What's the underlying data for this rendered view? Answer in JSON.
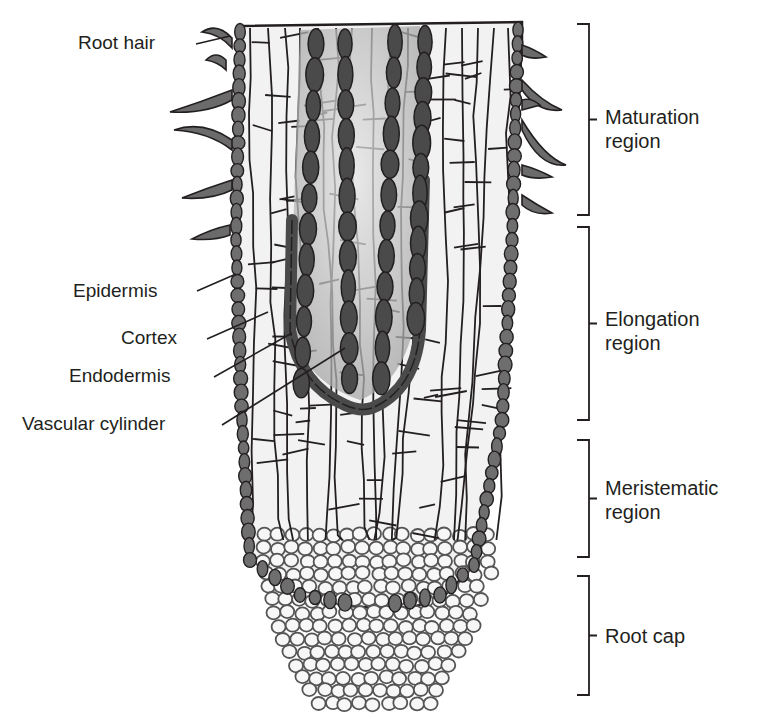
{
  "labels": {
    "root_hair": "Root hair",
    "epidermis": "Epidermis",
    "cortex": "Cortex",
    "endodermis": "Endodermis",
    "vascular_cylinder": "Vascular cylinder"
  },
  "regions": [
    {
      "line1": "Maturation",
      "line2": "region"
    },
    {
      "line1": "Elongation",
      "line2": "region"
    },
    {
      "line1": "Meristematic",
      "line2": "region"
    },
    {
      "line1": "Root cap",
      "line2": ""
    }
  ],
  "colors": {
    "outline": "#231f20",
    "dark_tissue": "#4a4a4a",
    "mid_tissue": "#8a8a8a",
    "light_tissue": "#d9d9d9",
    "cell_fill": "#f2f2f2",
    "cap_stroke": "#555555"
  }
}
